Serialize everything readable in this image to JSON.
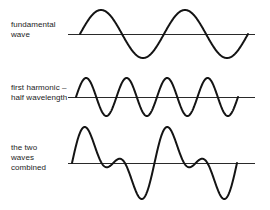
{
  "figure": {
    "width": 270,
    "height": 210,
    "background_color": "#ffffff",
    "stroke_color": "#141414",
    "baseline_color": "#2a2a2a",
    "label_color": "#1c1c1c"
  },
  "panels": [
    {
      "id": "fundamental",
      "label": "fundamental\nwave",
      "baseline_y": 34,
      "baseline_x_start": 68,
      "baseline_x_end": 255,
      "wave_x_start": 80,
      "wave_x_end": 248,
      "cycles": 2,
      "amplitude": 24
    },
    {
      "id": "first-harmonic",
      "label": "first harmonic –\nhalf wavelength",
      "baseline_y": 97,
      "baseline_x_start": 68,
      "baseline_x_end": 255,
      "wave_x_start": 76,
      "wave_x_end": 238,
      "cycles": 4,
      "amplitude": 19
    },
    {
      "id": "combined",
      "label": "the two\nwaves\ncombined",
      "baseline_y": 163,
      "baseline_x_start": 68,
      "baseline_x_end": 255,
      "wave_x_start": 72,
      "wave_x_end": 237,
      "cycles": 2,
      "amplitude": 36
    }
  ],
  "chart_data": {
    "type": "line",
    "xlabel": "",
    "ylabel": "",
    "grid": false,
    "legend_position": "left",
    "x_domain": [
      0,
      1
    ],
    "series": [
      {
        "name": "fundamental wave",
        "label": "fundamental\nwave",
        "waveform": "sine",
        "cycles": 2,
        "amplitude": 1.0,
        "phase": 0,
        "baseline_y": 34,
        "x_pixel_range": [
          80,
          248
        ],
        "amplitude_pixels": 24
      },
      {
        "name": "first harmonic – half wavelength",
        "label": "first harmonic –\nhalf wavelength",
        "waveform": "sine",
        "cycles": 4,
        "amplitude": 0.79,
        "phase": 0,
        "baseline_y": 97,
        "x_pixel_range": [
          76,
          238
        ],
        "amplitude_pixels": 19
      },
      {
        "name": "the two waves combined",
        "label": "the two\nwaves\ncombined",
        "waveform": "sum",
        "components": [
          {
            "cycles": 2,
            "amplitude": 1.0
          },
          {
            "cycles": 4,
            "amplitude": 0.79
          }
        ],
        "baseline_y": 163,
        "x_pixel_range": [
          72,
          237
        ],
        "amplitude_pixels": 36
      }
    ]
  }
}
